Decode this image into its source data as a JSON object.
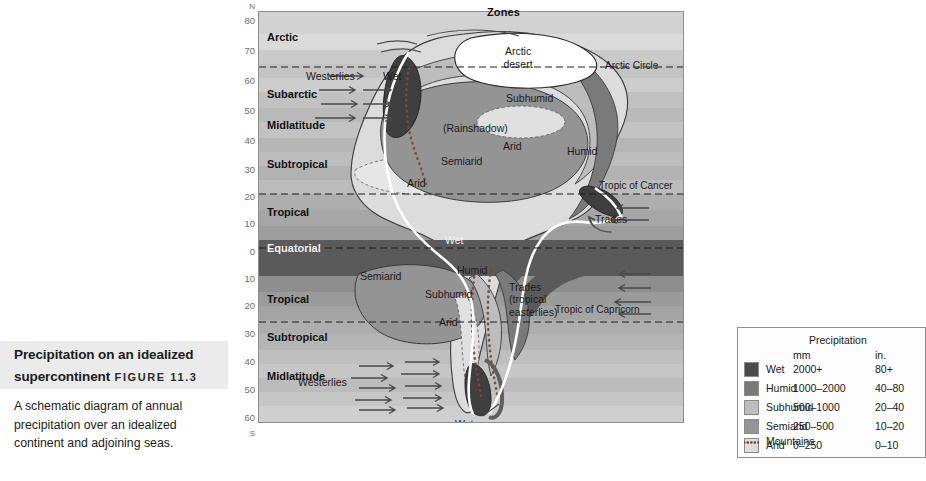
{
  "caption": {
    "title": "Precipitation on an idealized supercontinent",
    "title_line1": "Precipitation on an idealized",
    "title_line2": "supercontinent",
    "figure_label": "Figure 11.3",
    "body": "A schematic diagram of annual precipitation over an idealized continent and adjoining seas."
  },
  "map": {
    "zones_header": "Zones",
    "latitude_axis": {
      "north_pole_label": "N",
      "south_pole_label": "S",
      "ticks": [
        "80",
        "70",
        "60",
        "50",
        "40",
        "30",
        "20",
        "10",
        "0",
        "10",
        "20",
        "30",
        "40",
        "50",
        "60"
      ]
    },
    "zones": [
      {
        "name": "Arctic",
        "hemisphere": "N"
      },
      {
        "name": "Subarctic",
        "hemisphere": "N"
      },
      {
        "name": "Midlatitude",
        "hemisphere": "N"
      },
      {
        "name": "Subtropical",
        "hemisphere": "N"
      },
      {
        "name": "Tropical",
        "hemisphere": "N"
      },
      {
        "name": "Equatorial",
        "hemisphere": "E"
      },
      {
        "name": "Tropical",
        "hemisphere": "S"
      },
      {
        "name": "Subtropical",
        "hemisphere": "S"
      },
      {
        "name": "Midlatitude",
        "hemisphere": "S"
      }
    ],
    "reference_lines": [
      "Arctic Circle",
      "Tropic of Cancer",
      "Tropic of Capricorn"
    ],
    "wind_labels": [
      "Westerlies",
      "Trades",
      "Trades (tropical easterlies)",
      "Westerlies"
    ],
    "feature_labels": [
      "Arctic desert",
      "Wet",
      "Subhumid",
      "(Rainshadow)",
      "Arid",
      "Semiarid",
      "Humid",
      "Arid",
      "Wet",
      "Semiarid",
      "Humid",
      "Subhumid",
      "Arid",
      "Wet"
    ],
    "label_arctic_desert_l1": "Arctic",
    "label_arctic_desert_l2": "desert",
    "label_wet_n": "Wet",
    "label_subhumid_n": "Subhumid",
    "label_rainshadow": "(Rainshadow)",
    "label_arid_n_inner": "Arid",
    "label_semiarid_n": "Semiarid",
    "label_humid_n": "Humid",
    "label_arid_n_west": "Arid",
    "label_wet_eq": "Wet",
    "label_semiarid_s": "Semiarid",
    "label_humid_s": "Humid",
    "label_subhumid_s": "Subhumid",
    "label_arid_s": "Arid",
    "label_wet_s": "Wet",
    "label_westerlies_n": "Westerlies",
    "label_wet_nw_coast": "Wet",
    "label_trades_n": "Trades",
    "label_trades_s_l1": "Trades",
    "label_trades_s_l2": "(tropical",
    "label_trades_s_l3": "easterlies)",
    "label_westerlies_s": "Westerlies",
    "label_arctic_circle": "Arctic Circle",
    "label_tropic_cancer": "Tropic of Cancer",
    "label_tropic_capricorn": "Tropic of Capricorn"
  },
  "legend": {
    "title": "Precipitation",
    "unit_mm": "mm",
    "unit_in": "in.",
    "rows": [
      {
        "name": "Wet",
        "mm": "2000+",
        "in": "80+",
        "color": "#4b4b4b"
      },
      {
        "name": "Humid",
        "mm": "1000–2000",
        "in": "40–80",
        "color": "#7a7a7a"
      },
      {
        "name": "Subhumid",
        "mm": "500–1000",
        "in": "20–40",
        "color": "#bdbdbd"
      },
      {
        "name": "Semiarid",
        "mm": "250–500",
        "in": "10–20",
        "color": "#949494"
      },
      {
        "name": "Arid",
        "mm": "0–250",
        "in": "0–10",
        "color": "#dcdcdc"
      }
    ],
    "mountains_label": "Mountains"
  },
  "colors": {
    "wet": "#4b4b4b",
    "humid": "#7a7a7a",
    "subhumid": "#bdbdbd",
    "semiarid": "#949494",
    "arid": "#dcdcdc",
    "arctic_desert": "#ffffff",
    "caption_box_bg": "#ebebeb",
    "panel_border": "#8e8e8e"
  }
}
